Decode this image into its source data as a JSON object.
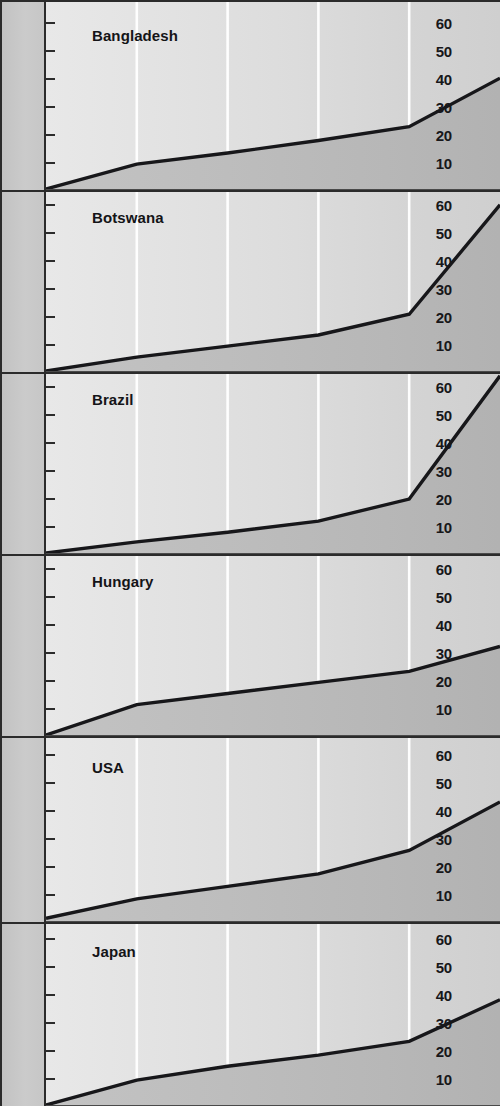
{
  "figure": {
    "name": "small-multiples-line-panels",
    "panel_count": 6,
    "y_ticks": [
      "60",
      "50",
      "40",
      "30",
      "20",
      "10"
    ],
    "colors": {
      "line": "#17171a",
      "axis": "#2b2b2b",
      "gutter": "#c6c6c6",
      "plot_light": "#e3e3e3",
      "plot_dark": "#b6b6b6",
      "gridline": "#ffffff"
    }
  },
  "chart_data": {
    "type": "area",
    "title": "",
    "xlabel": "",
    "ylabel": "",
    "ylim": [
      0,
      65
    ],
    "y_ticks": [
      10,
      20,
      30,
      40,
      50,
      60
    ],
    "grid": "vertical white gridlines at 4 interior positions",
    "legend": "none",
    "x": [
      0,
      1,
      2,
      3,
      4,
      5
    ],
    "panels": [
      {
        "label": "Bangladesh",
        "values": [
          0,
          9,
          13,
          17.5,
          22.5,
          40
        ]
      },
      {
        "label": "Botswana",
        "values": [
          0,
          5,
          9,
          13,
          20.5,
          60
        ]
      },
      {
        "label": "Brazil",
        "values": [
          0,
          4,
          7.5,
          11.5,
          19.5,
          64
        ]
      },
      {
        "label": "Hungary",
        "values": [
          0,
          11,
          15,
          19,
          23,
          32
        ]
      },
      {
        "label": "USA",
        "values": [
          1,
          8,
          12.5,
          17,
          25.5,
          43
        ]
      },
      {
        "label": "Japan",
        "values": [
          0,
          9,
          14,
          18,
          23,
          38
        ]
      }
    ]
  }
}
